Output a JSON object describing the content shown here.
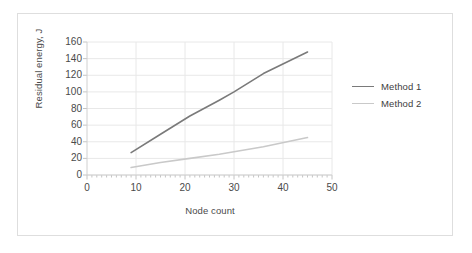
{
  "figure": {
    "border_color": "#dedede",
    "background": "#ffffff"
  },
  "chart_data": {
    "type": "line",
    "title": "",
    "xlabel": "Node count",
    "ylabel": "Residual energy, J",
    "xlim": [
      0,
      50
    ],
    "ylim": [
      0,
      160
    ],
    "xticks": [
      0,
      10,
      20,
      30,
      40,
      50
    ],
    "yticks": [
      0,
      20,
      40,
      60,
      80,
      100,
      120,
      140,
      160
    ],
    "xtick_labels": [
      "0",
      "10",
      "20",
      "30",
      "40",
      "50"
    ],
    "ytick_labels": [
      "0",
      "20",
      "40",
      "60",
      "80",
      "100",
      "120",
      "140",
      "160"
    ],
    "grid": true,
    "grid_color": "#e8e8e8",
    "legend_position": "right",
    "series": [
      {
        "name": "Method 1",
        "color": "#7a7a7a",
        "x": [
          9,
          15,
          21,
          27,
          30,
          36,
          45
        ],
        "values": [
          27,
          49,
          71,
          90,
          100,
          122,
          148
        ]
      },
      {
        "name": "Method 2",
        "color": "#c9c9c9",
        "x": [
          9,
          15,
          21,
          27,
          30,
          36,
          45
        ],
        "values": [
          9,
          15,
          20,
          25,
          28,
          34,
          45
        ]
      }
    ]
  },
  "legend": {
    "items": [
      {
        "label": "Method 1",
        "color": "#7a7a7a"
      },
      {
        "label": "Method 2",
        "color": "#c9c9c9"
      }
    ]
  },
  "axis": {
    "line_color": "#d0d0d0",
    "tick_color": "#c4c4c4",
    "label_color": "#4a4a4a"
  }
}
